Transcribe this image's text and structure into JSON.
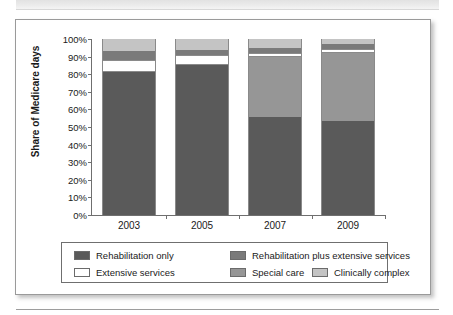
{
  "page": {
    "top_banner_text": "",
    "background_color": "#ffffff"
  },
  "chart_data": {
    "type": "bar",
    "subtype": "stacked-percent",
    "title": "",
    "xlabel": "",
    "ylabel": "Share of Medicare days",
    "ylim": [
      0,
      100
    ],
    "ytick_labels": [
      "100%",
      "90%",
      "80%",
      "70%",
      "60%",
      "50%",
      "40%",
      "30%",
      "20%",
      "10%",
      "0%"
    ],
    "ytick_values": [
      100,
      90,
      80,
      70,
      60,
      50,
      40,
      30,
      20,
      10,
      0
    ],
    "categories": [
      "2003",
      "2005",
      "2007",
      "2009"
    ],
    "grid": false,
    "legend_position": "bottom",
    "series": [
      {
        "name": "Rehabilitation only",
        "color": "#5a5a5a",
        "values": [
          81,
          85,
          55.5,
          53.5
        ]
      },
      {
        "name": "Extensive services",
        "color": "#ffffff",
        "values": [
          7,
          9.5,
          0,
          0
        ]
      },
      {
        "name": "Rehabilitation plus extensive services",
        "color": "#7a7a7a",
        "values": [
          0,
          0,
          0,
          0
        ]
      },
      {
        "name": "Special care",
        "color": "#969696",
        "values": [
          5,
          3,
          34,
          38.5
        ]
      },
      {
        "name": "Clinically complex",
        "color": "#c4c4c4",
        "values": [
          7,
          2.5,
          10.5,
          8
        ]
      }
    ],
    "stacks": [
      {
        "category": "2003",
        "segments": [
          {
            "name": "Rehabilitation only",
            "value": 81,
            "color": "#5a5a5a"
          },
          {
            "name": "Extensive services",
            "value": 7,
            "color": "#ffffff"
          },
          {
            "name": "Rehabilitation plus extensive services",
            "value": 5,
            "color": "#7a7a7a"
          },
          {
            "name": "Clinically complex",
            "value": 7,
            "color": "#c4c4c4"
          }
        ]
      },
      {
        "category": "2005",
        "segments": [
          {
            "name": "Rehabilitation only",
            "value": 85,
            "color": "#5a5a5a"
          },
          {
            "name": "Extensive services",
            "value": 6,
            "color": "#ffffff"
          },
          {
            "name": "Rehabilitation plus extensive services",
            "value": 3,
            "color": "#7a7a7a"
          },
          {
            "name": "Clinically complex",
            "value": 6,
            "color": "#c4c4c4"
          }
        ]
      },
      {
        "category": "2007",
        "segments": [
          {
            "name": "Rehabilitation only",
            "value": 55.5,
            "color": "#5a5a5a"
          },
          {
            "name": "Special care",
            "value": 34,
            "color": "#969696"
          },
          {
            "name": "Extensive services",
            "value": 2.5,
            "color": "#ffffff"
          },
          {
            "name": "Rehabilitation plus extensive services",
            "value": 3,
            "color": "#7a7a7a"
          },
          {
            "name": "Clinically complex",
            "value": 5,
            "color": "#c4c4c4"
          }
        ]
      },
      {
        "category": "2009",
        "segments": [
          {
            "name": "Rehabilitation only",
            "value": 53.5,
            "color": "#5a5a5a"
          },
          {
            "name": "Special care",
            "value": 38.5,
            "color": "#969696"
          },
          {
            "name": "Extensive services",
            "value": 2.5,
            "color": "#ffffff"
          },
          {
            "name": "Rehabilitation plus extensive services",
            "value": 2.5,
            "color": "#7a7a7a"
          },
          {
            "name": "Clinically complex",
            "value": 3,
            "color": "#c4c4c4"
          }
        ]
      }
    ],
    "legend": [
      {
        "label": "Rehabilitation only",
        "color": "#5a5a5a"
      },
      {
        "label": "Rehabilitation plus extensive services",
        "color": "#7a7a7a"
      },
      {
        "label": "Extensive services",
        "color": "#ffffff"
      },
      {
        "label": "Special care",
        "color": "#969696"
      },
      {
        "label": "Clinically complex",
        "color": "#c4c4c4"
      }
    ]
  }
}
